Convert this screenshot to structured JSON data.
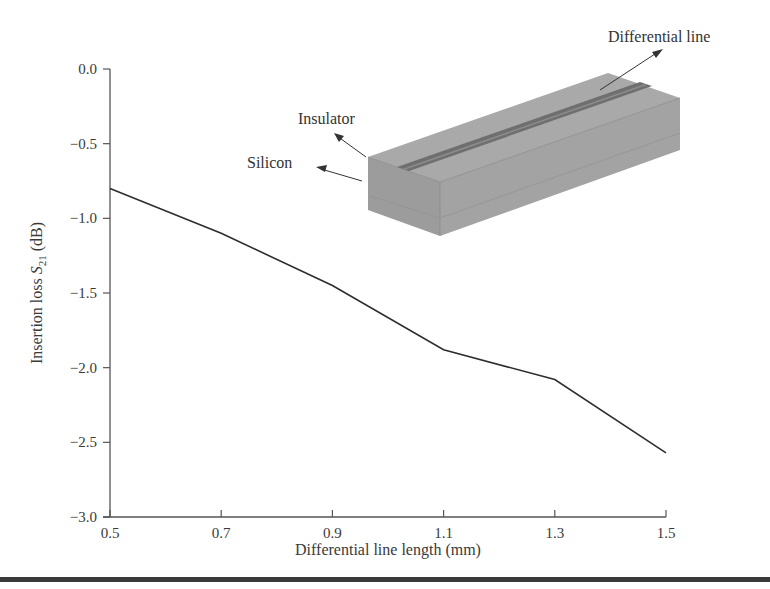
{
  "chart_data": {
    "type": "line",
    "title": "",
    "xlabel": "Differential line length (mm)",
    "ylabel_prefix": "Insertion loss ",
    "ylabel_symbol": "S",
    "ylabel_subscript": "21",
    "ylabel_suffix": " (dB)",
    "ylabel": "Insertion loss S21 (dB)",
    "x": [
      0.5,
      0.7,
      0.9,
      1.1,
      1.3,
      1.5
    ],
    "series": [
      {
        "name": "Insertion loss S21",
        "values": [
          -0.8,
          -1.1,
          -1.45,
          -1.88,
          -2.08,
          -2.57
        ],
        "color": "#2e2e2e"
      }
    ],
    "xlim": [
      0.5,
      1.5
    ],
    "ylim": [
      -3.0,
      0.0
    ],
    "xticks": [
      "0.5",
      "0.7",
      "0.9",
      "1.1",
      "1.3",
      "1.5"
    ],
    "yticks": [
      "0.0",
      "−0.5",
      "−1.0",
      "−1.5",
      "−2.0",
      "−2.5",
      "−3.0"
    ],
    "grid": false,
    "legend": null,
    "annotations": [
      {
        "text": "Differential line",
        "target": "differential line on top of insulator"
      },
      {
        "text": "Insulator",
        "target": "insulator layer"
      },
      {
        "text": "Silicon",
        "target": "silicon substrate"
      }
    ],
    "inset": "3D block diagram of a silicon substrate with insulator layer and a differential line pair on top"
  },
  "colors": {
    "line": "#2e2e2e",
    "axis": "#555555",
    "block_top": "#a9a9a9",
    "block_front": "#9a9a9a",
    "block_side": "#a2a2a2",
    "diff_line": "#6f6f6f"
  }
}
